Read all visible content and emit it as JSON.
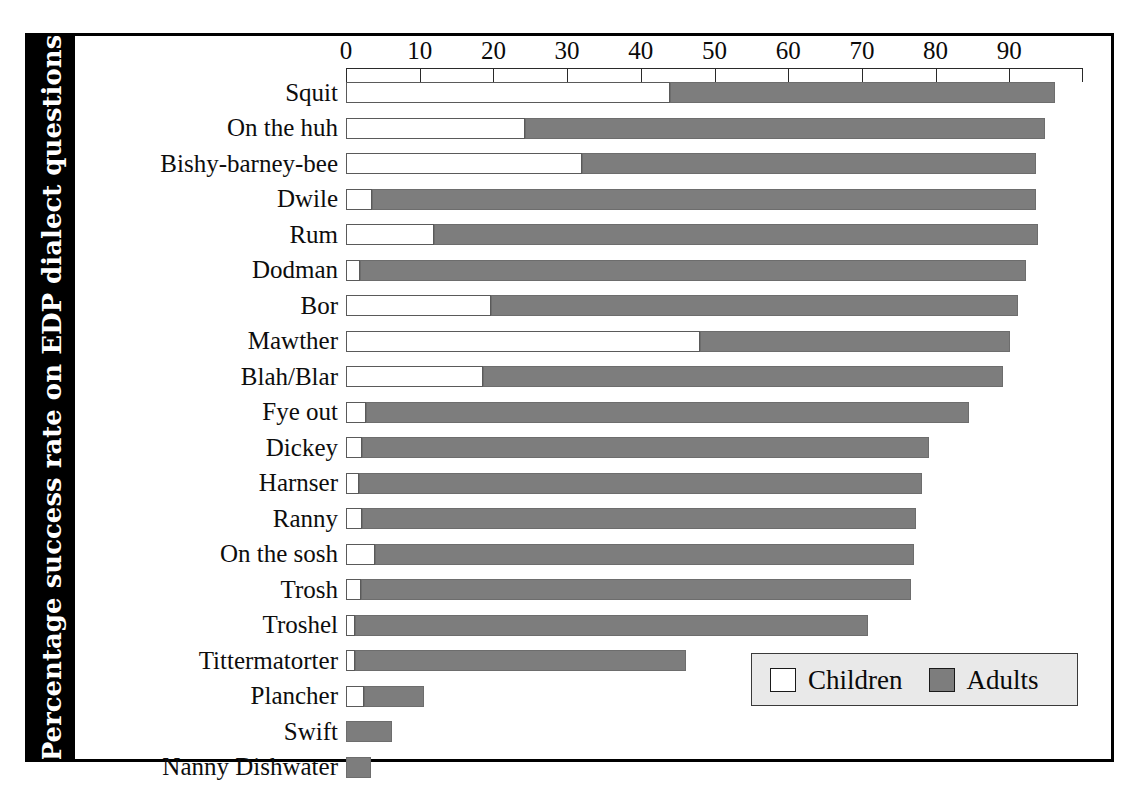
{
  "chart_data": {
    "type": "bar",
    "orientation": "horizontal",
    "stacked": true,
    "title": "",
    "subtitle": "",
    "xlabel": "",
    "ylabel": "Percentage success rate on EDP dialect questions",
    "xlim": [
      0,
      100
    ],
    "ylim": null,
    "grid": false,
    "xticks": [
      0,
      10,
      20,
      30,
      40,
      50,
      60,
      70,
      80,
      90
    ],
    "xtick_labels": [
      "0",
      "10",
      "20",
      "30",
      "40",
      "50",
      "60",
      "70",
      "80",
      "90"
    ],
    "legend": {
      "position": "bottom-right",
      "entries": [
        {
          "name": "Children",
          "color": "#ffffff"
        },
        {
          "name": "Adults",
          "color": "#7d7d7d"
        }
      ]
    },
    "categories": [
      "Squit",
      "On the huh",
      "Bishy-barney-bee",
      "Dwile",
      "Rum",
      "Dodman",
      "Bor",
      "Mawther",
      "Blah/Blar",
      "Fye out",
      "Dickey",
      "Harnser",
      "Ranny",
      "On the sosh",
      "Trosh",
      "Troshel",
      "Tittermatorter",
      "Plancher",
      "Swift",
      "Nanny Dishwater"
    ],
    "series": [
      {
        "name": "Children",
        "color": "#ffffff",
        "values": [
          44.0,
          24.3,
          32.0,
          3.5,
          12.0,
          1.9,
          19.7,
          48.0,
          18.6,
          2.7,
          2.2,
          1.8,
          2.2,
          3.9,
          2.0,
          1.2,
          1.2,
          2.4,
          0.0,
          0.0
        ]
      },
      {
        "name": "Adults",
        "color": "#7d7d7d",
        "values": [
          96.2,
          94.8,
          93.6,
          93.6,
          93.9,
          92.3,
          91.2,
          90.1,
          89.1,
          84.5,
          79.1,
          78.2,
          77.3,
          77.1,
          76.7,
          70.8,
          46.1,
          10.6,
          6.2,
          3.4
        ]
      }
    ]
  },
  "axis_title": {
    "text": "Percentage success rate on EDP dialect questions"
  },
  "legend": {
    "children_label": "Children",
    "adults_label": "Adults"
  },
  "colors": {
    "adults": "#7d7d7d",
    "children": "#ffffff",
    "frame": "#000000",
    "band": "#000000",
    "legend_bg": "#e9e9e9"
  }
}
